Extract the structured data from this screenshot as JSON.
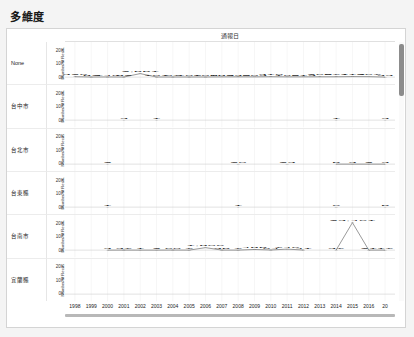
{
  "page": {
    "title": "多維度"
  },
  "header": {
    "row_dimension_label": "縣市鄉市",
    "column_header": "通報日"
  },
  "axis": {
    "y_title": "Number of Reco..",
    "y_ticks": [
      "20K",
      "10K",
      "0K"
    ],
    "y_max": 20000,
    "x_labels": [
      "1998",
      "1999",
      "2000",
      "2001",
      "2002",
      "2003",
      "2004",
      "2005",
      "2006",
      "2007",
      "2008",
      "2009",
      "2010",
      "2011",
      "2012",
      "2013",
      "2014",
      "2015",
      "2016",
      "20"
    ]
  },
  "scrollbar": {
    "vertical_name": "vertical-scrollbar"
  },
  "chart_data": {
    "type": "line",
    "title": "多維度",
    "xlabel": "通報日",
    "ylabel": "Number of Reco..",
    "ylim": [
      0,
      20000
    ],
    "grid": true,
    "legend": "none",
    "x": [
      "1998",
      "1999",
      "2000",
      "2001",
      "2002",
      "2003",
      "2004",
      "2005",
      "2006",
      "2007",
      "2008",
      "2009",
      "2010",
      "2011",
      "2012",
      "2013",
      "2014",
      "2015",
      "2016",
      "2017"
    ],
    "panels": [
      {
        "row_label": "None",
        "values": [
          326,
          82,
          140,
          82,
          2551,
          101,
          97,
          107,
          108,
          183,
          230,
          203,
          310,
          196,
          213,
          265,
          271,
          412,
          367,
          33
        ],
        "labels": [
          "326",
          "82",
          "140",
          "82",
          "2,551",
          "101",
          "97",
          "107",
          "108",
          "183",
          "230",
          "203",
          "310",
          "196",
          "213",
          "265",
          "271",
          "412",
          "367",
          "33"
        ]
      },
      {
        "row_label": "台中市",
        "values": [
          null,
          null,
          null,
          3,
          null,
          1,
          null,
          null,
          null,
          null,
          null,
          null,
          null,
          null,
          null,
          null,
          1,
          null,
          null,
          3
        ],
        "labels": [
          "",
          "",
          "",
          "3",
          "",
          "1",
          "",
          "",
          "",
          "",
          "",
          "",
          "",
          "",
          "",
          "",
          "1",
          "",
          "",
          "3"
        ]
      },
      {
        "row_label": "台北市",
        "values": [
          null,
          null,
          2,
          null,
          null,
          null,
          null,
          null,
          null,
          null,
          20,
          null,
          null,
          23,
          null,
          null,
          5,
          3,
          2,
          3
        ],
        "labels": [
          "",
          "",
          "2",
          "",
          "",
          "",
          "",
          "",
          "",
          "",
          "20",
          "",
          "",
          "23",
          "",
          "",
          "5",
          "3",
          "2",
          "3"
        ]
      },
      {
        "row_label": "台東縣",
        "values": [
          null,
          null,
          1,
          null,
          null,
          null,
          null,
          null,
          null,
          null,
          1,
          null,
          null,
          null,
          null,
          null,
          6,
          null,
          null,
          5
        ],
        "labels": [
          "",
          "",
          "1",
          "",
          "",
          "",
          "",
          "",
          "",
          "",
          "1",
          "",
          "",
          "",
          "",
          "",
          "6",
          "",
          "",
          "5"
        ]
      },
      {
        "row_label": "台南市",
        "values": [
          null,
          null,
          3,
          37,
          1,
          2,
          60,
          7,
          1806,
          35,
          7,
          485,
          94,
          746,
          41,
          null,
          37,
          23461,
          21,
          17
        ],
        "labels": [
          "",
          "",
          "3",
          "37",
          "1",
          "2",
          "60",
          "7",
          "1,806",
          "35",
          "7",
          "485",
          "94",
          "746",
          "41",
          "",
          "37",
          "23,461",
          "21",
          "17"
        ]
      },
      {
        "row_label": "宜蘭縣",
        "values": [
          null,
          null,
          null,
          null,
          null,
          null,
          null,
          null,
          null,
          null,
          null,
          null,
          null,
          null,
          null,
          null,
          null,
          null,
          null,
          null
        ],
        "labels": [
          "",
          "",
          "",
          "",
          "",
          "",
          "",
          "",
          "",
          "",
          "",
          "",
          "",
          "",
          "",
          "",
          "",
          "",
          "",
          ""
        ]
      }
    ]
  }
}
